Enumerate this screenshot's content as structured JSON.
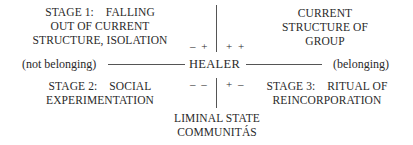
{
  "diagram": {
    "center": {
      "label": "HEALER"
    },
    "horizontal_axis": {
      "left_label": "(not belonging)",
      "right_label": "(belonging)"
    },
    "quadrants": {
      "top_left": {
        "lines": [
          "STAGE 1:    FALLING",
          "OUT OF CURRENT",
          "STRUCTURE, ISOLATION"
        ],
        "sign": "– +"
      },
      "top_right": {
        "lines": [
          "CURRENT",
          "STRUCTURE OF",
          "GROUP"
        ],
        "sign": "+ +"
      },
      "bottom_left": {
        "lines": [
          "STAGE 2:    SOCIAL",
          "EXPERIMENTATION"
        ],
        "sign": "– –"
      },
      "bottom_right": {
        "lines": [
          "STAGE 3:    RITUAL OF",
          "REINCORPORATION"
        ],
        "sign": "+ –"
      }
    },
    "bottom": {
      "lines": [
        "LIMINAL STATE",
        "COMMUNITÁS"
      ]
    }
  }
}
